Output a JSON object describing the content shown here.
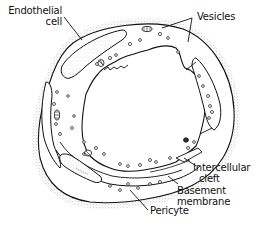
{
  "figure": {
    "labels": {
      "endothelial_cell_line1": "Endothelial",
      "endothelial_cell_line2": "cell",
      "vesicles": "Vesicles",
      "intercellular_cleft_line1": "Intercellular",
      "intercellular_cleft_line2": "cleft",
      "basement_membrane_line1": "Basement",
      "basement_membrane_line2": "membrane",
      "pericyte": "Pericyte"
    },
    "colors": {
      "line": "#111111",
      "stipple": "#9a9a9a",
      "background": "#ffffff"
    }
  }
}
